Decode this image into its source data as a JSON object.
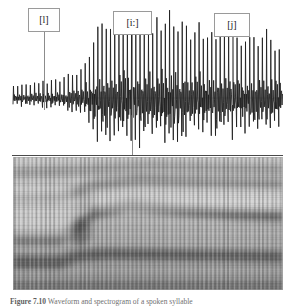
{
  "figure": {
    "caption_prefix": "Figure 7.10",
    "caption_text": "Waveform and spectrogram of a spoken syllable",
    "background_color": "#ffffff",
    "divider_color": "#4a4a4a"
  },
  "labels": [
    {
      "text": "[l]",
      "x": 28,
      "y": 8,
      "width": 32,
      "height": 24,
      "leader_x": 44,
      "leader_top": 32,
      "leader_bottom": 110
    },
    {
      "text": "[i:]",
      "x": 113,
      "y": 11,
      "width": 39,
      "height": 24,
      "leader_x": 132,
      "leader_top": 35,
      "leader_bottom": 155
    },
    {
      "text": "[j]",
      "x": 214,
      "y": 13,
      "width": 36,
      "height": 24,
      "leader_x": 232,
      "leader_top": 37,
      "leader_bottom": 105
    }
  ],
  "waveform": {
    "name": "speech-waveform",
    "x_start": 13,
    "x_end": 283,
    "baseline_y": 98,
    "panel_height": 156,
    "stroke_color": "#1c1c1c",
    "pulse_count": 64,
    "description": "Periodic glottal pulse train, amplitude rising left to right with a peak in the [i:] region",
    "envelope": [
      0.14,
      0.15,
      0.16,
      0.16,
      0.17,
      0.17,
      0.18,
      0.18,
      0.19,
      0.2,
      0.21,
      0.22,
      0.23,
      0.25,
      0.27,
      0.3,
      0.34,
      0.4,
      0.52,
      0.68,
      0.82,
      0.9,
      0.86,
      0.8,
      0.84,
      0.88,
      0.83,
      0.78,
      0.82,
      0.88,
      0.92,
      0.86,
      0.8,
      0.76,
      0.84,
      0.9,
      0.95,
      1.0,
      0.92,
      0.84,
      0.88,
      0.8,
      0.74,
      0.78,
      0.82,
      0.76,
      0.7,
      0.74,
      0.78,
      0.72,
      0.68,
      0.72,
      0.76,
      0.7,
      0.66,
      0.7,
      0.74,
      0.68,
      0.64,
      0.68,
      0.72,
      0.66,
      0.62,
      0.6
    ]
  },
  "chart_data": {
    "type": "heatmap",
    "xlabel": "Time",
    "ylabel": "Frequency",
    "grid": false,
    "legend": "none",
    "colormap": "grayscale",
    "x_range_px": [
      13,
      283
    ],
    "y_range_px": [
      157,
      290
    ],
    "striation_count": 62,
    "segments": [
      {
        "label": "[l]",
        "x_start": 13,
        "x_end": 72
      },
      {
        "label": "[i:]",
        "x_start": 72,
        "x_end": 178
      },
      {
        "label": "[j]",
        "x_start": 178,
        "x_end": 283
      }
    ],
    "formants": [
      {
        "name": "F1",
        "points": [
          {
            "x": 13,
            "y": 262,
            "intensity": 0.86,
            "band": 13
          },
          {
            "x": 60,
            "y": 262,
            "intensity": 0.86,
            "band": 13
          },
          {
            "x": 78,
            "y": 256,
            "intensity": 0.92,
            "band": 12
          },
          {
            "x": 110,
            "y": 254,
            "intensity": 0.84,
            "band": 11
          },
          {
            "x": 178,
            "y": 255,
            "intensity": 0.8,
            "band": 11
          },
          {
            "x": 240,
            "y": 256,
            "intensity": 0.78,
            "band": 11
          },
          {
            "x": 283,
            "y": 257,
            "intensity": 0.76,
            "band": 11
          }
        ]
      },
      {
        "name": "F2",
        "points": [
          {
            "x": 13,
            "y": 238,
            "intensity": 0.72,
            "band": 12
          },
          {
            "x": 58,
            "y": 238,
            "intensity": 0.74,
            "band": 12
          },
          {
            "x": 76,
            "y": 230,
            "intensity": 0.95,
            "band": 13
          },
          {
            "x": 96,
            "y": 212,
            "intensity": 0.9,
            "band": 12
          },
          {
            "x": 130,
            "y": 205,
            "intensity": 0.82,
            "band": 11
          },
          {
            "x": 180,
            "y": 210,
            "intensity": 0.76,
            "band": 11
          },
          {
            "x": 235,
            "y": 214,
            "intensity": 0.74,
            "band": 11
          },
          {
            "x": 283,
            "y": 216,
            "intensity": 0.72,
            "band": 11
          }
        ]
      },
      {
        "name": "F3",
        "points": [
          {
            "x": 13,
            "y": 200,
            "intensity": 0.42,
            "band": 11
          },
          {
            "x": 60,
            "y": 198,
            "intensity": 0.4,
            "band": 11
          },
          {
            "x": 90,
            "y": 186,
            "intensity": 0.52,
            "band": 10
          },
          {
            "x": 140,
            "y": 180,
            "intensity": 0.5,
            "band": 10
          },
          {
            "x": 200,
            "y": 182,
            "intensity": 0.48,
            "band": 10
          },
          {
            "x": 283,
            "y": 184,
            "intensity": 0.46,
            "band": 10
          }
        ]
      },
      {
        "name": "F4",
        "points": [
          {
            "x": 13,
            "y": 172,
            "intensity": 0.34,
            "band": 10
          },
          {
            "x": 70,
            "y": 170,
            "intensity": 0.36,
            "band": 10
          },
          {
            "x": 150,
            "y": 166,
            "intensity": 0.4,
            "band": 10
          },
          {
            "x": 230,
            "y": 168,
            "intensity": 0.38,
            "band": 10
          },
          {
            "x": 283,
            "y": 169,
            "intensity": 0.36,
            "band": 10
          }
        ]
      }
    ],
    "low_energy_band": {
      "y": 286,
      "band": 9,
      "intensity": 0.9
    }
  }
}
